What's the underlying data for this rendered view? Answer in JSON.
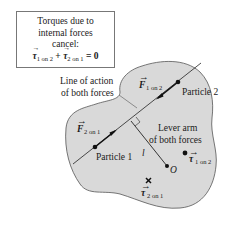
{
  "caption_box": {
    "line1": "Torques due to",
    "line2": "internal forces",
    "line3": "cancel:",
    "equation": {
      "term1_symbol": "τ",
      "term1_sub": "1 on 2",
      "plus": "+",
      "term2_symbol": "τ",
      "term2_sub": "2 on 1",
      "equals": "=",
      "result": "0"
    }
  },
  "labels": {
    "line_of_action_1": "Line of action",
    "line_of_action_2": "of both forces",
    "lever_arm_1": "Lever arm",
    "lever_arm_2": "of both forces",
    "particle1": "Particle 1",
    "particle2": "Particle 2",
    "lever_symbol": "l",
    "origin": "O",
    "f12_symbol": "F",
    "f12_sub": "1 on 2",
    "f21_symbol": "F",
    "f21_sub": "2 on 1",
    "tau12_symbol": "τ",
    "tau12_sub": "1 on 2",
    "tau21_symbol": "τ",
    "tau21_sub": "2 on 1"
  },
  "colors": {
    "body_fill": "#d9d9d9",
    "body_stroke": "#555555",
    "ink": "#1a1a1a"
  }
}
